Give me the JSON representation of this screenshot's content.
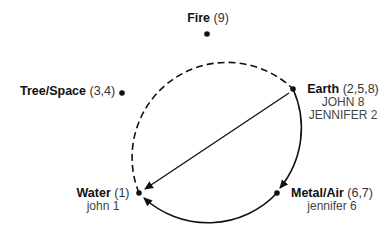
{
  "diagram": {
    "nodes": {
      "fire": {
        "name": "Fire",
        "numbers": "(9)",
        "sub": []
      },
      "tree_space": {
        "name": "Tree/Space",
        "numbers": "(3,4)",
        "sub": []
      },
      "earth": {
        "name": "Earth",
        "numbers": "(2,5,8)",
        "sub": [
          "JOHN 8",
          "JENNIFER 2"
        ]
      },
      "metal_air": {
        "name": "Metal/Air",
        "numbers": "(6,7)",
        "sub": [
          "jennifer 6"
        ]
      },
      "water": {
        "name": "Water",
        "numbers": "(1)",
        "sub": [
          "john 1"
        ]
      }
    },
    "edges": [
      {
        "from": "Earth",
        "to": "Water",
        "style": "solid-chord-arrow"
      },
      {
        "from": "Earth",
        "to": "Metal/Air",
        "style": "solid-arc-arrow"
      },
      {
        "from": "Metal/Air",
        "to": "Water",
        "style": "solid-arc-arrow"
      },
      {
        "from": "Water",
        "to": "Earth",
        "via": [
          "Tree/Space",
          "Fire"
        ],
        "style": "dashed-arc"
      }
    ],
    "colors": {
      "line": "#111111",
      "background": "#ffffff"
    }
  }
}
